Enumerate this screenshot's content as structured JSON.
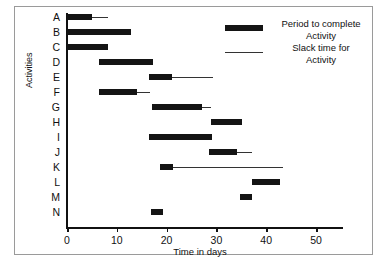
{
  "chart_data": {
    "type": "bar",
    "chart_subtype": "gantt",
    "title": "",
    "xlabel": "Time in days",
    "ylabel": "Activities",
    "xlim": [
      0,
      55.5
    ],
    "xticks": [
      0,
      10,
      20,
      30,
      40,
      50
    ],
    "xtick_labels": [
      "0",
      "10",
      "20",
      "30",
      "40",
      "50"
    ],
    "grid": false,
    "categories": [
      "A",
      "B",
      "C",
      "D",
      "E",
      "F",
      "G",
      "H",
      "I",
      "J",
      "K",
      "L",
      "M",
      "N"
    ],
    "legend": {
      "position": "top-right",
      "entries": [
        {
          "key": "bar",
          "label": "Period to complete Activity",
          "line1": "Period to complete",
          "line2": "Activity"
        },
        {
          "key": "line",
          "label": "Slack time for Activity",
          "line1": "Slack time for",
          "line2": "Activity"
        }
      ]
    },
    "tasks": [
      {
        "activity": "A",
        "start": 0.0,
        "duration": 5.0,
        "end": 5.0,
        "slack_end": 8.2
      },
      {
        "activity": "B",
        "start": 0.0,
        "duration": 12.8,
        "end": 12.8,
        "slack_end": 12.8
      },
      {
        "activity": "C",
        "start": 0.0,
        "duration": 8.2,
        "end": 8.2,
        "slack_end": 8.2
      },
      {
        "activity": "D",
        "start": 6.4,
        "duration": 10.8,
        "end": 17.2,
        "slack_end": 17.2
      },
      {
        "activity": "E",
        "start": 16.4,
        "duration": 4.6,
        "end": 21.0,
        "slack_end": 29.4
      },
      {
        "activity": "F",
        "start": 6.4,
        "duration": 7.6,
        "end": 14.0,
        "slack_end": 16.6
      },
      {
        "activity": "G",
        "start": 17.0,
        "duration": 10.2,
        "end": 27.2,
        "slack_end": 29.0
      },
      {
        "activity": "H",
        "start": 29.0,
        "duration": 6.2,
        "end": 35.2,
        "slack_end": 35.2
      },
      {
        "activity": "I",
        "start": 16.4,
        "duration": 12.8,
        "end": 29.2,
        "slack_end": 29.2
      },
      {
        "activity": "J",
        "start": 28.6,
        "duration": 5.6,
        "end": 34.2,
        "slack_end": 37.2
      },
      {
        "activity": "K",
        "start": 18.6,
        "duration": 2.6,
        "end": 21.2,
        "slack_end": 43.4
      },
      {
        "activity": "L",
        "start": 37.2,
        "duration": 5.6,
        "end": 42.8,
        "slack_end": 42.8
      },
      {
        "activity": "M",
        "start": 34.8,
        "duration": 2.4,
        "end": 37.2,
        "slack_end": 37.2
      },
      {
        "activity": "N",
        "start": 16.8,
        "duration": 2.4,
        "end": 19.2,
        "slack_end": 19.2
      }
    ]
  },
  "colors": {
    "bar": "#141414",
    "slack": "#333333",
    "axis": "#111111",
    "frame": "#9a9a9a",
    "background": "#ffffff"
  }
}
